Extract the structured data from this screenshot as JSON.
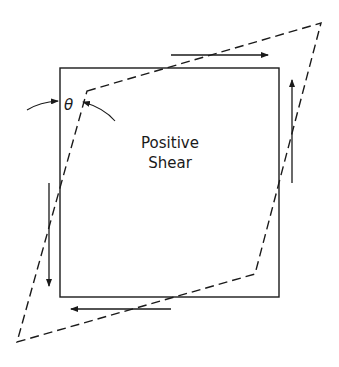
{
  "diagram": {
    "label_line1": "Positive",
    "label_line2": "Shear",
    "angle_symbol": "θ",
    "stroke_color": "#1a1a1a",
    "background": "#ffffff",
    "original_square": {
      "x": 60,
      "y": 68,
      "width": 219,
      "height": 229
    },
    "deformed_shape": [
      [
        87,
        91
      ],
      [
        321,
        23
      ],
      [
        255,
        274
      ],
      [
        17,
        342
      ]
    ],
    "shear_arrows": [
      {
        "name": "top",
        "direction": "right"
      },
      {
        "name": "right",
        "direction": "up"
      },
      {
        "name": "bottom",
        "direction": "left"
      },
      {
        "name": "left",
        "direction": "down"
      }
    ]
  }
}
